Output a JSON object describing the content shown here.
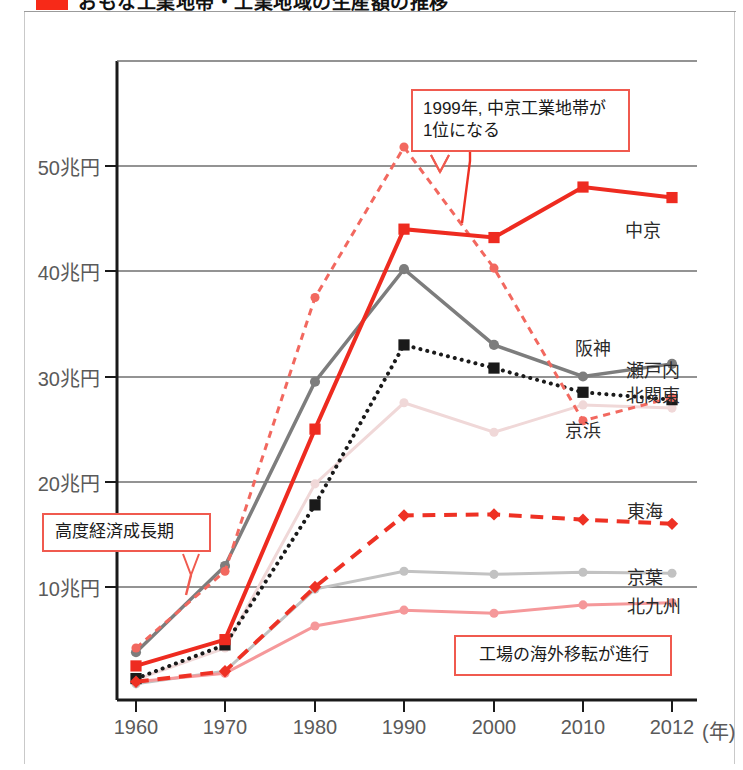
{
  "header": {
    "title": "おもな工業地帯・工業地域の生産額の推移",
    "swatch_color": "#f72a18"
  },
  "callouts": [
    {
      "id": "peak-1999",
      "line1": "1999年, 中京工業地帯が",
      "line2": "1位になる"
    },
    {
      "id": "growth-era",
      "line1": "高度経済成長期",
      "line2": ""
    },
    {
      "id": "offshoring",
      "line1": "工場の海外移転が進行",
      "line2": ""
    }
  ],
  "axis": {
    "y_ticks": [
      "10兆円",
      "20兆円",
      "30兆円",
      "40兆円",
      "50兆円"
    ],
    "x_ticks": [
      "1960",
      "1970",
      "1980",
      "1990",
      "2000",
      "2010",
      "2012"
    ],
    "x_unit": "(年)"
  },
  "chart_data": {
    "type": "line",
    "title": "おもな工業地帯・工業地域の生産額の推移",
    "xlabel": "年",
    "ylabel": "生産額 (兆円)",
    "x": [
      1960,
      1970,
      1980,
      1990,
      2000,
      2010,
      2012
    ],
    "xlim": [
      1957,
      2014
    ],
    "ylim": [
      0,
      56
    ],
    "y_ticks": [
      10,
      20,
      30,
      40,
      50
    ],
    "grid": "horizontal",
    "legend": "right-inline",
    "series": [
      {
        "name": "中京",
        "label": "中京",
        "color": "#ee2b20",
        "style": "solid",
        "width": 4,
        "marker": "square",
        "values": [
          2.5,
          5.0,
          25.0,
          44.0,
          43.2,
          48.0,
          47.0
        ]
      },
      {
        "name": "京浜",
        "label": "京浜",
        "color": "#f2685f",
        "style": "dashed",
        "width": 3,
        "marker": "circle",
        "values": [
          4.2,
          11.5,
          37.5,
          51.8,
          40.3,
          25.8,
          28.0
        ]
      },
      {
        "name": "阪神",
        "label": "阪神",
        "color": "#7d7d7d",
        "style": "solid",
        "width": 3.5,
        "marker": "circle",
        "values": [
          3.8,
          12.0,
          29.5,
          40.2,
          33.0,
          30.0,
          31.2
        ]
      },
      {
        "name": "北関東",
        "label": "北関東",
        "color": "#1a1a1a",
        "style": "dotted",
        "width": 4,
        "marker": "square",
        "values": [
          1.3,
          4.5,
          17.8,
          33.0,
          30.8,
          28.5,
          27.8
        ]
      },
      {
        "name": "瀬戸内",
        "label": "瀬戸内",
        "color": "#f0d8d8",
        "style": "solid",
        "width": 3,
        "marker": "circle",
        "values": [
          1.2,
          4.2,
          19.8,
          27.5,
          24.7,
          27.3,
          27.0
        ]
      },
      {
        "name": "東海",
        "label": "東海",
        "color": "#ee3124",
        "style": "dashed-long",
        "width": 4,
        "marker": "diamond",
        "values": [
          1.0,
          2.0,
          10.0,
          16.8,
          16.9,
          16.4,
          16.0
        ]
      },
      {
        "name": "京葉",
        "label": "京葉",
        "color": "#c2c2c2",
        "style": "solid",
        "width": 3,
        "marker": "circle",
        "values": [
          0.8,
          2.0,
          9.8,
          11.5,
          11.2,
          11.4,
          11.3
        ]
      },
      {
        "name": "北九州",
        "label": "北九州",
        "color": "#f5989a",
        "style": "solid",
        "width": 3,
        "marker": "circle",
        "values": [
          1.0,
          1.8,
          6.3,
          7.8,
          7.5,
          8.3,
          8.5
        ]
      }
    ],
    "annotations": [
      {
        "text": "1999年, 中京工業地帯が1位になる",
        "points_to_x": 2000,
        "points_to_y": 43
      },
      {
        "text": "高度経済成長期",
        "points_to_x": 1967,
        "points_to_y": 13
      },
      {
        "text": "工場の海外移転が進行",
        "points_to_x": null,
        "points_to_y": null
      }
    ]
  }
}
